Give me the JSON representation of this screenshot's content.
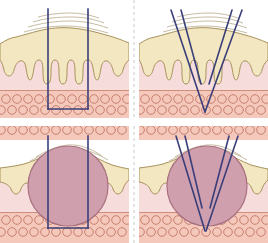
{
  "figure": {
    "width": 268,
    "height": 243,
    "background": "#ffffff",
    "layout": "2x2 panel grid separated by dashed divider"
  },
  "colors": {
    "background": "#ffffff",
    "stratum_corneum_line": "#b9a98a",
    "epidermis_fill": "#f2e7c0",
    "epidermis_outline": "#a8925c",
    "dermis_fill": "#f7dcdc",
    "dermis_outline": "#e0b6b6",
    "fat_fill": "#f4c9bb",
    "fat_outline": "#cf8d7c",
    "fat_cell_outline": "#c98070",
    "lesion_fill": "#cf9fae",
    "lesion_outline": "#a8707f",
    "beam_stroke": "#3a3f7a",
    "divider": "#c9c9c9"
  },
  "panels": [
    {
      "id": "top-left",
      "data_name": "panel-collimated-no-lesion",
      "position": "top-left",
      "beam_type": "collimated",
      "beam_label": "Parallel (collimated) beam",
      "beam_line_count": 2,
      "lesion_present": false,
      "description": "Two parallel vertical beam lines pass straight through epidermis and dermis, terminating with a horizontal line in the subcutaneous fat layer, forming an open rectangle.",
      "layers": [
        "stratum corneum",
        "epidermis",
        "dermis",
        "subcutaneous fat"
      ]
    },
    {
      "id": "top-right",
      "data_name": "panel-focused-no-lesion",
      "position": "top-right",
      "beam_type": "focused",
      "beam_label": "Converging (focused) beam",
      "beam_line_count": 4,
      "lesion_present": false,
      "description": "Four converging beam lines form a V, inner pair focusing at the dermis-fat junction and outer pair focusing deeper within the subcutaneous fat.",
      "layers": [
        "stratum corneum",
        "epidermis",
        "dermis",
        "subcutaneous fat"
      ]
    },
    {
      "id": "bottom-left",
      "data_name": "panel-collimated-with-lesion",
      "position": "bottom-left",
      "beam_type": "collimated",
      "beam_label": "Parallel (collimated) beam",
      "beam_line_count": 2,
      "lesion_present": true,
      "lesion_label": "Subcutaneous lesion",
      "description": "Two parallel vertical beam lines bracket a large round lesion that elevates the skin surface; the beam closes with a horizontal line inside the fat layer.",
      "layers": [
        "stratum corneum",
        "epidermis",
        "dermis",
        "subcutaneous fat",
        "lesion"
      ]
    },
    {
      "id": "bottom-right",
      "data_name": "panel-focused-with-lesion",
      "position": "bottom-right",
      "beam_type": "focused",
      "beam_label": "Converging (focused) beam",
      "beam_line_count": 4,
      "lesion_present": true,
      "lesion_label": "Subcutaneous lesion",
      "description": "Four converging beam lines form a V through a large round lesion that elevates the skin surface, focusing below the lesion in the fat layer.",
      "layers": [
        "stratum corneum",
        "epidermis",
        "dermis",
        "subcutaneous fat",
        "lesion"
      ]
    }
  ]
}
